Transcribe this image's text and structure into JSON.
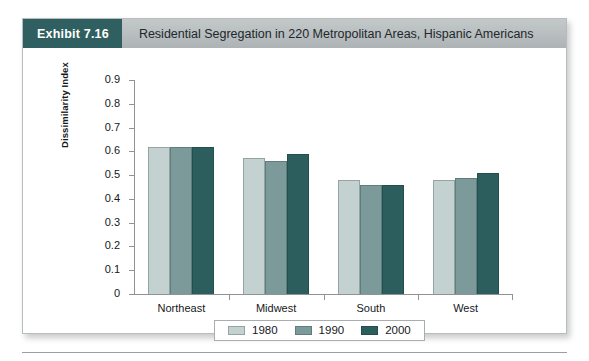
{
  "exhibit": {
    "badge_label": "Exhibit 7.16",
    "title": "Residential Segregation in 220 Metropolitan Areas, Hispanic Americans",
    "badge_color": "#2f5f60",
    "header_color": "#b8bdbf"
  },
  "chart_data": {
    "type": "bar",
    "title": "Residential Segregation in 220 Metropolitan Areas, Hispanic Americans",
    "xlabel": "",
    "ylabel": "Dissimilarity Index",
    "ylim": [
      0,
      0.9
    ],
    "ytick_labels": [
      "0.9",
      "0.8",
      "0.7",
      "0.6",
      "0.5",
      "0.4",
      "0.3",
      "0.2",
      "0.1",
      "0"
    ],
    "ytick_values": [
      0.9,
      0.8,
      0.7,
      0.6,
      0.5,
      0.4,
      0.3,
      0.2,
      0.1,
      0
    ],
    "grid": false,
    "legend_position": "bottom",
    "categories": [
      "Northeast",
      "Midwest",
      "South",
      "West"
    ],
    "series": [
      {
        "name": "1980",
        "color": "#c3d2d0",
        "values": [
          0.62,
          0.57,
          0.48,
          0.48
        ]
      },
      {
        "name": "1990",
        "color": "#7c9a99",
        "values": [
          0.62,
          0.56,
          0.46,
          0.49
        ]
      },
      {
        "name": "2000",
        "color": "#2d5e5e",
        "values": [
          0.62,
          0.59,
          0.46,
          0.51
        ]
      }
    ]
  }
}
